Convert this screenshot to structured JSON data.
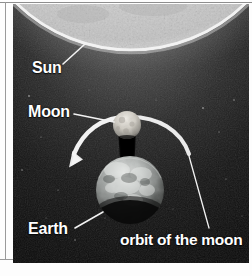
{
  "figure": {
    "background_color": "#141414",
    "label_color": "#ffffff",
    "labels": [
      {
        "id": "sun",
        "text": "Sun",
        "target": "sun-sphere"
      },
      {
        "id": "moon",
        "text": "Moon",
        "target": "moon-sphere"
      },
      {
        "id": "earth",
        "text": "Earth",
        "target": "earth-sphere"
      },
      {
        "id": "orbit",
        "text": "orbit of the moon",
        "target": "orbit-arc"
      }
    ],
    "bodies": [
      {
        "id": "sun",
        "name": "Sun",
        "color": "#cfcfcf",
        "shape": "partial-disc-top"
      },
      {
        "id": "moon",
        "name": "Moon",
        "color": "#cdc9c2",
        "shape": "small-sphere"
      },
      {
        "id": "earth",
        "name": "Earth",
        "color": "#b9bcbb",
        "shape": "sphere"
      }
    ],
    "annotations": {
      "orbit_arc": "white curved arrow showing the moon's orbital direction",
      "arrow_direction": "counterclockwise, arrowhead at lower left",
      "shadow": "moon's shadow cone pointing away from the sun"
    }
  }
}
